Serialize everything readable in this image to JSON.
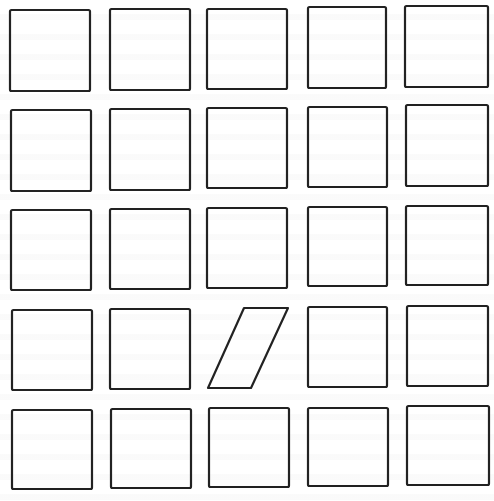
{
  "figure": {
    "rows": 5,
    "cols": 5,
    "stroke_color": "#222222",
    "background_color": "#ffffff",
    "odd_one_out": {
      "row": 4,
      "col": 3,
      "shape": "parallelogram"
    },
    "cells": [
      {
        "row": 1,
        "col": 1,
        "shape": "square",
        "x": 10,
        "y": 10,
        "w": 80,
        "h": 81
      },
      {
        "row": 1,
        "col": 2,
        "shape": "square",
        "x": 110,
        "y": 9,
        "w": 80,
        "h": 81
      },
      {
        "row": 1,
        "col": 3,
        "shape": "square",
        "x": 207,
        "y": 9,
        "w": 80,
        "h": 80
      },
      {
        "row": 1,
        "col": 4,
        "shape": "square",
        "x": 308,
        "y": 7,
        "w": 78,
        "h": 81
      },
      {
        "row": 1,
        "col": 5,
        "shape": "square",
        "x": 405,
        "y": 6,
        "w": 83,
        "h": 81
      },
      {
        "row": 2,
        "col": 1,
        "shape": "square",
        "x": 11,
        "y": 110,
        "w": 80,
        "h": 81
      },
      {
        "row": 2,
        "col": 2,
        "shape": "square",
        "x": 110,
        "y": 109,
        "w": 80,
        "h": 81
      },
      {
        "row": 2,
        "col": 3,
        "shape": "square",
        "x": 207,
        "y": 108,
        "w": 80,
        "h": 80
      },
      {
        "row": 2,
        "col": 4,
        "shape": "square",
        "x": 308,
        "y": 107,
        "w": 79,
        "h": 80
      },
      {
        "row": 2,
        "col": 5,
        "shape": "square",
        "x": 406,
        "y": 105,
        "w": 82,
        "h": 81
      },
      {
        "row": 3,
        "col": 1,
        "shape": "square",
        "x": 11,
        "y": 210,
        "w": 80,
        "h": 80
      },
      {
        "row": 3,
        "col": 2,
        "shape": "square",
        "x": 110,
        "y": 209,
        "w": 80,
        "h": 80
      },
      {
        "row": 3,
        "col": 3,
        "shape": "square",
        "x": 207,
        "y": 208,
        "w": 80,
        "h": 80
      },
      {
        "row": 3,
        "col": 4,
        "shape": "square",
        "x": 308,
        "y": 207,
        "w": 79,
        "h": 79
      },
      {
        "row": 3,
        "col": 5,
        "shape": "square",
        "x": 406,
        "y": 206,
        "w": 82,
        "h": 79
      },
      {
        "row": 4,
        "col": 1,
        "shape": "square",
        "x": 12,
        "y": 310,
        "w": 80,
        "h": 80
      },
      {
        "row": 4,
        "col": 2,
        "shape": "square",
        "x": 110,
        "y": 309,
        "w": 80,
        "h": 80
      },
      {
        "row": 4,
        "col": 3,
        "shape": "parallelogram",
        "points": "244,308 288,308 251,388 208,388"
      },
      {
        "row": 4,
        "col": 4,
        "shape": "square",
        "x": 308,
        "y": 307,
        "w": 79,
        "h": 80
      },
      {
        "row": 4,
        "col": 5,
        "shape": "square",
        "x": 407,
        "y": 306,
        "w": 81,
        "h": 80
      },
      {
        "row": 5,
        "col": 1,
        "shape": "square",
        "x": 12,
        "y": 410,
        "w": 80,
        "h": 79
      },
      {
        "row": 5,
        "col": 2,
        "shape": "square",
        "x": 111,
        "y": 409,
        "w": 80,
        "h": 79
      },
      {
        "row": 5,
        "col": 3,
        "shape": "square",
        "x": 209,
        "y": 408,
        "w": 80,
        "h": 79
      },
      {
        "row": 5,
        "col": 4,
        "shape": "square",
        "x": 308,
        "y": 408,
        "w": 80,
        "h": 78
      },
      {
        "row": 5,
        "col": 5,
        "shape": "square",
        "x": 407,
        "y": 406,
        "w": 82,
        "h": 79
      }
    ]
  }
}
